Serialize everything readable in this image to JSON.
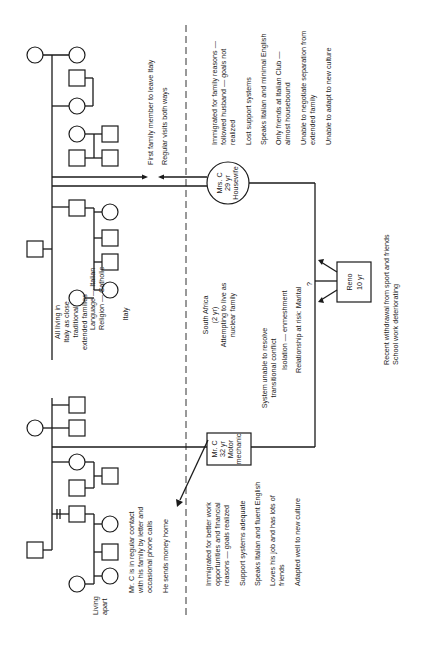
{
  "orientation": "rotated 90 degrees counter-clockwise",
  "regions": {
    "italy": {
      "summary_lines": [
        "All living in",
        "Italy as close",
        "traditional",
        "extended families"
      ],
      "culture_lines": [
        "Language — Italian",
        "Religion — Catholic"
      ],
      "country": "Italy"
    },
    "south_africa": {
      "lines": [
        "South Africa",
        "(2 yr)",
        "Attempting to live as",
        "nuclear family"
      ],
      "system_lines": [
        "System unable to resolve",
        "transitional conflict"
      ],
      "isolation": "Isolation — enmeshment",
      "relationship": "Relationship at risk: Marital"
    }
  },
  "people": {
    "mrs_c": {
      "lines": [
        "Mrs. C",
        "29 yr",
        "Housewife"
      ],
      "shape": "circle"
    },
    "mr_c": {
      "lines": [
        "Mr. C",
        "32 yr",
        "Motor",
        "mechanic"
      ],
      "shape": "square"
    },
    "reno": {
      "lines": [
        "Reno",
        "10 yr"
      ],
      "shape": "square"
    }
  },
  "annotations": {
    "mrs_c_family": [
      "First family member to leave Italy",
      "Regular visits both ways"
    ],
    "mrs_c_notes": [
      "Immigrated for family reasons —",
      "followed husband — goals not",
      "realized",
      "Lost support systems",
      "Speaks Italian and minimal English",
      "Only friends at Italian Club —",
      "almost housebound",
      "Unable to negotiate separation from",
      "extended family",
      "Unable to adapt to new culture"
    ],
    "mr_c_family": [
      "Mr. C is in regular contact",
      "with his family by letter and",
      "occasional phone calls",
      "He sends money home"
    ],
    "mr_c_notes": [
      "Immigrated for better work",
      "opportunities and financial",
      "reasons — goals realized",
      "Support systems adequate",
      "Speaks Italian and fluent English",
      "Loves his job and has lots of",
      "friends",
      "Adapted well to new culture"
    ],
    "reno_notes": [
      "Recent withdrawal from sport and friends",
      "School work deteriorating"
    ],
    "living_apart": [
      "Living",
      "apart"
    ],
    "question_mark": "?"
  }
}
